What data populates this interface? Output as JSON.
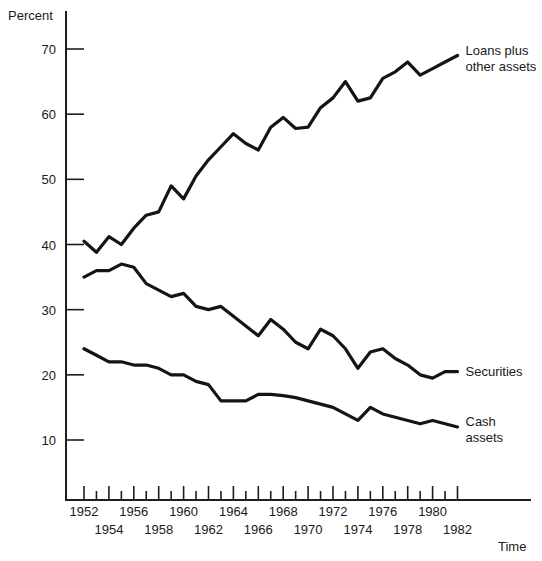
{
  "chart_data": {
    "type": "line",
    "title": "",
    "xlabel": "Time",
    "ylabel": "Percent",
    "ylim": [
      0,
      74
    ],
    "xlim": [
      1951,
      1983
    ],
    "grid": false,
    "legend_position": "right-inline",
    "y_ticks": [
      70,
      60,
      50,
      40,
      30,
      20,
      10
    ],
    "x_ticks": [
      1952,
      1953,
      1954,
      1955,
      1956,
      1957,
      1958,
      1959,
      1960,
      1961,
      1962,
      1963,
      1964,
      1965,
      1966,
      1967,
      1968,
      1969,
      1970,
      1971,
      1972,
      1973,
      1974,
      1975,
      1976,
      1977,
      1978,
      1979,
      1980,
      1981,
      1982
    ],
    "x_tick_labels_upper": [
      1952,
      1956,
      1960,
      1964,
      1968,
      1972,
      1976,
      1980
    ],
    "x_tick_labels_lower": [
      1954,
      1958,
      1962,
      1966,
      1970,
      1974,
      1978,
      1982
    ],
    "x": [
      1952,
      1953,
      1954,
      1955,
      1956,
      1957,
      1958,
      1959,
      1960,
      1961,
      1962,
      1963,
      1964,
      1965,
      1966,
      1967,
      1968,
      1969,
      1970,
      1971,
      1972,
      1973,
      1974,
      1975,
      1976,
      1977,
      1978,
      1979,
      1980,
      1981,
      1982
    ],
    "series": [
      {
        "name": "Loans plus other assets",
        "label_line1": "Loans plus",
        "label_line2": "other assets",
        "values": [
          40.5,
          38.8,
          41.2,
          40.0,
          42.5,
          44.5,
          45.0,
          49.0,
          47.0,
          50.5,
          53.0,
          55.0,
          57.0,
          55.5,
          54.5,
          58.0,
          59.5,
          57.8,
          58.0,
          61.0,
          62.5,
          65.0,
          62.0,
          62.5,
          65.5,
          66.5,
          68.0,
          66.0,
          67.0,
          68.0,
          69.0
        ]
      },
      {
        "name": "Securities",
        "label_line1": "Securities",
        "label_line2": "",
        "values": [
          35.0,
          36.0,
          36.0,
          37.0,
          36.5,
          34.0,
          33.0,
          32.0,
          32.5,
          30.5,
          30.0,
          30.5,
          29.0,
          27.5,
          26.0,
          28.5,
          27.0,
          25.0,
          24.0,
          27.0,
          26.0,
          24.0,
          21.0,
          23.5,
          24.0,
          22.5,
          21.5,
          20.0,
          19.5,
          20.5,
          20.5
        ]
      },
      {
        "name": "Cash assets",
        "label_line1": "Cash",
        "label_line2": "assets",
        "values": [
          24.0,
          23.0,
          22.0,
          22.0,
          21.5,
          21.5,
          21.0,
          20.0,
          20.0,
          19.0,
          18.5,
          16.0,
          16.0,
          16.0,
          17.0,
          17.0,
          16.8,
          16.5,
          16.0,
          15.5,
          15.0,
          14.0,
          13.0,
          15.0,
          14.0,
          13.5,
          13.0,
          12.5,
          13.0,
          12.5,
          12.0
        ]
      }
    ]
  },
  "axis": {
    "y_title": "Percent",
    "x_title": "Time"
  },
  "colors": {
    "line": "#141414",
    "axis": "#1d1d1d",
    "text": "#1a1a1a",
    "background": "#ffffff"
  }
}
